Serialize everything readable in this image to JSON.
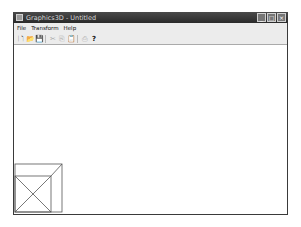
{
  "window": {
    "title": "Graphics3D - Untitled",
    "controls": {
      "minimize": "_",
      "maximize": "□",
      "close": "×"
    }
  },
  "menu": [
    "File",
    "Transform",
    "Help"
  ],
  "toolbar": [
    {
      "name": "new-icon",
      "glyph": "🗋",
      "enabled": true
    },
    {
      "name": "open-icon",
      "glyph": "📂",
      "enabled": true
    },
    {
      "name": "save-icon",
      "glyph": "💾",
      "enabled": true
    },
    {
      "name": "cut-icon",
      "glyph": "✂",
      "enabled": false
    },
    {
      "name": "copy-icon",
      "glyph": "⎘",
      "enabled": false
    },
    {
      "name": "paste-icon",
      "glyph": "📋",
      "enabled": false
    },
    {
      "name": "print-icon",
      "glyph": "⎙",
      "enabled": false
    },
    {
      "name": "help-icon",
      "glyph": "?",
      "enabled": true
    }
  ],
  "canvas": {
    "shape": "wireframe-cube",
    "stroke": "#555555"
  }
}
